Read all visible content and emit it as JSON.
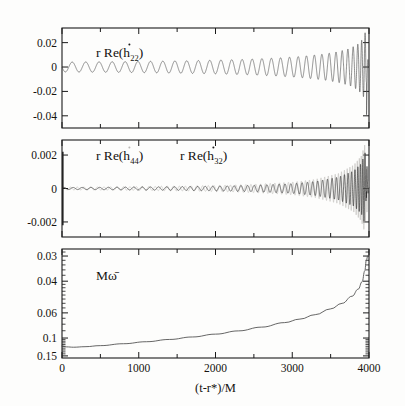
{
  "figure": {
    "type": "multi-panel-scientific-plot",
    "background": "#fdfdfc",
    "ink": "#1a1a1a",
    "faint_ink": "#b9b7b3",
    "x_axis_title": "(t-r*)/M",
    "x_ticks": [
      "0",
      "1000",
      "2000",
      "3000",
      "4000"
    ],
    "x_range": [
      0,
      4000
    ],
    "x_minor_step": 500
  },
  "panels": {
    "top": {
      "label_prefix": "r Re(",
      "label_symbol": "h",
      "label_sub": "22",
      "label_suffix": ")",
      "y_ticks": [
        "0.02",
        "0",
        "-0.02",
        "-0.04"
      ],
      "y_values": [
        0.02,
        0,
        -0.02,
        -0.04
      ],
      "y_range": [
        -0.05,
        0.032
      ],
      "scale": "linear"
    },
    "middle": {
      "label_faint_prefix": "r Re(",
      "label_faint_symbol": "h",
      "label_faint_sub": "44",
      "label_faint_suffix": ")",
      "label_prefix": "r Re(",
      "label_symbol": "h",
      "label_sub": "32",
      "label_suffix": ")",
      "y_ticks": [
        "0.002",
        "0",
        "-0.002"
      ],
      "y_values": [
        0.002,
        0,
        -0.002
      ],
      "y_range": [
        -0.0029,
        0.0029
      ],
      "scale": "linear"
    },
    "bottom": {
      "label": "Mω̄",
      "y_ticks": [
        "0.15",
        "0.1",
        "0.06",
        "0.04",
        "0.03"
      ],
      "y_values": [
        0.15,
        0.1,
        0.06,
        0.04,
        0.03
      ],
      "y_range": [
        0.029,
        0.168
      ],
      "scale": "log"
    }
  },
  "chart_data": {
    "type": "line",
    "title": "",
    "xlabel": "(t-r*)/M",
    "ylabel": "",
    "xlim": [
      0,
      4000
    ],
    "grid": false,
    "legend": "none",
    "panels": [
      {
        "name": "top",
        "ylabel": "r Re(h_dot_22)",
        "ylim": [
          -0.05,
          0.032
        ],
        "yscale": "linear",
        "yticks": [
          0.02,
          0,
          -0.02,
          -0.04
        ],
        "description": "Inspiral-merger-ringdown waveform of the l=m=2 mode; slowly growing sinusoid from t=0 with amplitude ~0.004 and period ~180 M, chirping to amplitude 0.02 (peak up) and -0.04 (peak down) just before t=3950, then abrupt ringdown damping at the right edge.",
        "series": [
          {
            "name": "r Re(h_dot_22)",
            "color": "#4a4a4a",
            "envelope_x": [
              0,
              400,
              800,
              1200,
              1600,
              2000,
              2400,
              2800,
              3100,
              3400,
              3600,
              3750,
              3850,
              3920,
              3960,
              3990,
              4000
            ],
            "envelope_amp": [
              0.004,
              0.0042,
              0.0044,
              0.0047,
              0.0051,
              0.0056,
              0.0063,
              0.0074,
              0.0086,
              0.0105,
              0.0126,
              0.0152,
              0.0185,
              0.023,
              0.03,
              0.04,
              0.018
            ],
            "frequency_x": [
              0,
              1000,
              2000,
              3000,
              3500,
              3800,
              3950,
              4000
            ],
            "frequency_Momega": [
              0.035,
              0.038,
              0.043,
              0.055,
              0.068,
              0.095,
              0.15,
              0.15
            ]
          }
        ]
      },
      {
        "name": "middle",
        "ylabel": "r Re(h_dot_44) and r Re(h_dot_32)",
        "ylim": [
          -0.0029,
          0.0029
        ],
        "yscale": "linear",
        "yticks": [
          0.002,
          0,
          -0.002
        ],
        "description": "Two subdominant modes overlaid: a faint grey l=4,m=4 trace and a black l=3,m=2 trace. Both are near-zero amplitude (<0.0002) through the inspiral, growing rapidly after t=3000 and reaching +/-0.002 and beyond at merger near t=3950.",
        "series": [
          {
            "name": "r Re(h_dot_44)",
            "color": "#b9b7b3",
            "envelope_x": [
              0,
              500,
              1000,
              1500,
              2000,
              2500,
              3000,
              3300,
              3600,
              3800,
              3900,
              3950,
              3980,
              4000
            ],
            "envelope_amp": [
              8e-05,
              9e-05,
              0.00011,
              0.00014,
              0.00018,
              0.00025,
              0.00038,
              0.00055,
              0.0009,
              0.0014,
              0.00195,
              0.0027,
              0.0023,
              0.0008
            ]
          },
          {
            "name": "r Re(h_dot_32)",
            "color": "#222222",
            "envelope_x": [
              0,
              500,
              1000,
              1500,
              2000,
              2500,
              3000,
              3300,
              3600,
              3800,
              3900,
              3950,
              3980,
              4000
            ],
            "envelope_amp": [
              6e-05,
              7e-05,
              9e-05,
              0.00011,
              0.00014,
              0.00019,
              0.00029,
              0.00042,
              0.00068,
              0.00105,
              0.0015,
              0.00215,
              0.0017,
              0.00055
            ]
          }
        ]
      },
      {
        "name": "bottom",
        "ylabel": "M omega-bar",
        "ylim": [
          0.029,
          0.168
        ],
        "yscale": "log",
        "yticks": [
          0.03,
          0.04,
          0.06,
          0.1,
          0.15
        ],
        "description": "Monotonically increasing gravitational-wave frequency on a logarithmic axis. Starts near 0.035, dips very slightly to 0.0345 around t=150, then climbs smoothly and accelerates, reaching 0.15 at t~3960 where it plateaus at the ringdown frequency.",
        "series": [
          {
            "name": "M omega-bar",
            "color": "#4a4a4a",
            "x": [
              0,
              60,
              150,
              300,
              500,
              800,
              1100,
              1400,
              1700,
              2000,
              2300,
              2600,
              2900,
              3100,
              3300,
              3500,
              3650,
              3780,
              3860,
              3910,
              3945,
              3965,
              3985,
              4000
            ],
            "y": [
              0.0352,
              0.0347,
              0.0345,
              0.0348,
              0.0354,
              0.0365,
              0.0377,
              0.0391,
              0.0407,
              0.0426,
              0.0449,
              0.0477,
              0.0513,
              0.0543,
              0.0583,
              0.064,
              0.07,
              0.0785,
              0.088,
              0.099,
              0.118,
              0.14,
              0.151,
              0.1515
            ]
          }
        ]
      }
    ]
  }
}
